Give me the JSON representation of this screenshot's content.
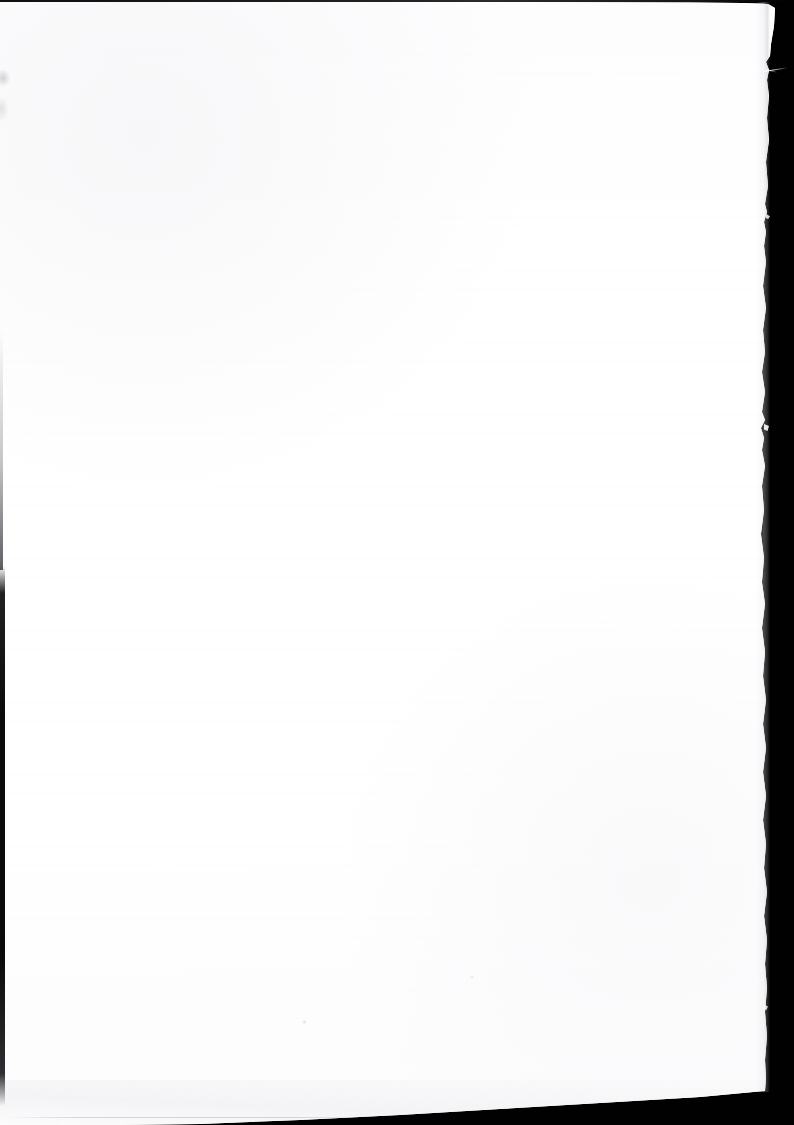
{
  "document": {
    "kind": "scanned-page",
    "page_content_text": "",
    "page_content_note": "Blank page — no printed text, figures or marks are visible on the scanned sheet.",
    "orientation": "portrait",
    "frame_width_px": 794,
    "frame_height_px": 1125
  },
  "colors": {
    "scanner_backdrop": "#010101",
    "paper_white": "#ffffff",
    "paper_tint": "#fdfdfe",
    "edge_shadow": "#0a0a0c",
    "top_band": "#1b1b20",
    "feather_grey": "#cecedc"
  },
  "sheet": {
    "top_edge_y_px": 2,
    "left_edge_x_px": 0,
    "right_edge_x_top_px": 775,
    "right_edge_x_bottom_px": 765,
    "bottom_edge_y_left_px": 1125,
    "bottom_edge_y_right_px": 1091,
    "right_edge_style": "torn / ragged",
    "bottom_edge_style": "straight, tilted",
    "tilt_note": "Sheet sits slightly rotated in the scanner: the bottom edge rises about 34 px from left to right."
  },
  "artifacts": {
    "top_edge_band": "top-edge-band",
    "left_gutter_strip": "left-gutter-strip",
    "left_gutter_fade": "left-gutter-fade",
    "right_edge_feather": "right-edge-feather",
    "bottom_edge_feather": "bottom-edge-feather",
    "bottom_scan_line": "bottom-scan-line",
    "ccd_banding": "ccd-banding",
    "edge_fibre_top": "paper-fibre-icon",
    "edge_nub_upper": "torn-nub-icon",
    "edge_nub_mid": "torn-nub-icon",
    "edge_nub_lower": "torn-nub-icon",
    "smudge_top_left": "smudge-icon",
    "smudge_mid_left": "smudge-icon",
    "fleck_low_center": "toner-fleck-icon",
    "fleck_mid_right": "toner-fleck-icon"
  }
}
